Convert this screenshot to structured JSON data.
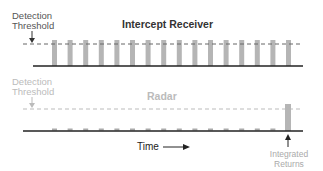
{
  "top_panel": {
    "title": "Intercept Receiver",
    "threshold_label_line1": "Detection",
    "threshold_label_line2": "Threshold",
    "bar_count": 16,
    "colors": {
      "text": "#444444",
      "bars": "#b5b5b5",
      "threshold": "#666666",
      "baseline": "#222222"
    }
  },
  "bottom_panel": {
    "title": "Radar",
    "threshold_label_line1": "Detection",
    "threshold_label_line2": "Threshold",
    "integrated_label_line1": "Integrated",
    "integrated_label_line2": "Returns",
    "pulse_count": 16,
    "colors": {
      "text": "#b8b8b8",
      "bars": "#b5b5b5",
      "threshold": "#bbbbbb",
      "baseline": "#222222"
    }
  },
  "axis": {
    "time_label": "Time"
  }
}
